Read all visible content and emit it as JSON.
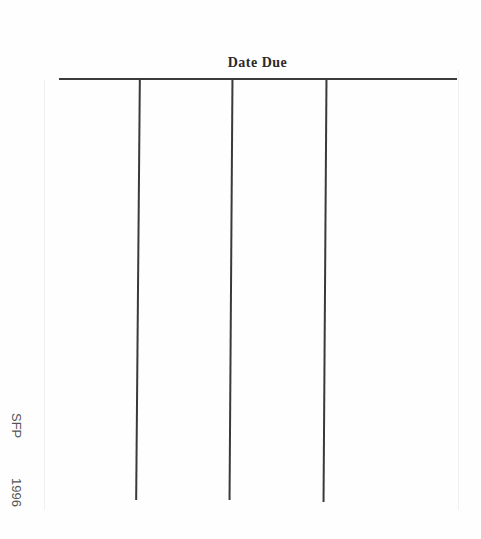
{
  "document": {
    "title": "Date Due",
    "columns": 4,
    "stamp": {
      "label": "SFP",
      "year": "1996"
    }
  }
}
